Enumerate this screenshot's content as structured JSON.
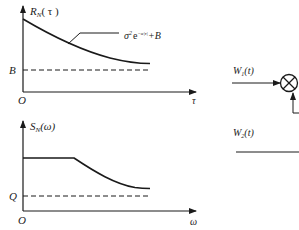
{
  "plot_top": {
    "y_axis_label_main": "R",
    "y_axis_label_sub": "N",
    "y_axis_label_arg": "( τ )",
    "x_axis_label": "τ",
    "origin_label": "O",
    "asymptote_label": "B",
    "formula_base": "σ",
    "formula_sup1": "2",
    "formula_e": "e",
    "formula_sup2": "−α|τ|",
    "formula_tail": "+B"
  },
  "plot_bottom": {
    "y_axis_label_main": "S",
    "y_axis_label_sub": "N",
    "y_axis_label_arg": "(ω)",
    "x_axis_label": "ω",
    "origin_label": "O",
    "asymptote_label": "Q"
  },
  "block_diagram": {
    "input1_main": "W",
    "input1_sub": "1",
    "input1_arg": "(t)",
    "input2_main": "W",
    "input2_sub": "2",
    "input2_arg": "(t)",
    "multiplier_symbol": "multiplier-circle-x"
  },
  "colors": {
    "stroke": "#1a1a1a",
    "background": "#ffffff"
  }
}
